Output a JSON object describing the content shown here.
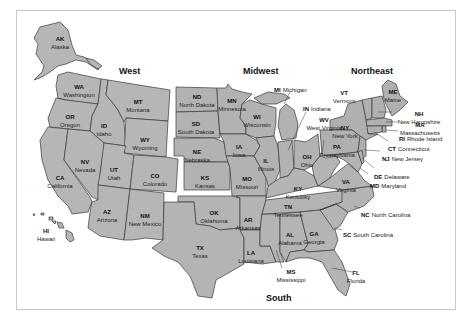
{
  "map": {
    "title": "United States Census Regions",
    "fill_color": "#b4b4b4",
    "border_color": "#3a3a3a",
    "background": "#ffffff",
    "frame_color": "#c8c8c8"
  },
  "regions": {
    "west": "West",
    "midwest": "Midwest",
    "northeast": "Northeast",
    "south": "South"
  },
  "states": {
    "AK": {
      "abbr": "AK",
      "name": "Alaska",
      "region": "West"
    },
    "HI": {
      "abbr": "HI",
      "name": "Hawaii",
      "region": "West"
    },
    "WA": {
      "abbr": "WA",
      "name": "Washington",
      "region": "West"
    },
    "OR": {
      "abbr": "OR",
      "name": "Oregon",
      "region": "West"
    },
    "CA": {
      "abbr": "CA",
      "name": "California",
      "region": "West"
    },
    "ID": {
      "abbr": "ID",
      "name": "Idaho",
      "region": "West"
    },
    "NV": {
      "abbr": "NV",
      "name": "Nevada",
      "region": "West"
    },
    "MT": {
      "abbr": "MT",
      "name": "Montana",
      "region": "West"
    },
    "WY": {
      "abbr": "WY",
      "name": "Wyoming",
      "region": "West"
    },
    "UT": {
      "abbr": "UT",
      "name": "Utah",
      "region": "West"
    },
    "CO": {
      "abbr": "CO",
      "name": "Colorado",
      "region": "West"
    },
    "AZ": {
      "abbr": "AZ",
      "name": "Arizona",
      "region": "West"
    },
    "NM": {
      "abbr": "NM",
      "name": "New Mexico",
      "region": "West"
    },
    "ND": {
      "abbr": "ND",
      "name": "North Dakota",
      "region": "Midwest"
    },
    "SD": {
      "abbr": "SD",
      "name": "South Dakota",
      "region": "Midwest"
    },
    "NE": {
      "abbr": "NE",
      "name": "Nebraska",
      "region": "Midwest"
    },
    "KS": {
      "abbr": "KS",
      "name": "Kansas",
      "region": "Midwest"
    },
    "MN": {
      "abbr": "MN",
      "name": "Minnesota",
      "region": "Midwest"
    },
    "IA": {
      "abbr": "IA",
      "name": "Iowa",
      "region": "Midwest"
    },
    "MO": {
      "abbr": "MO",
      "name": "Missouri",
      "region": "Midwest"
    },
    "WI": {
      "abbr": "WI",
      "name": "Wisconsin",
      "region": "Midwest"
    },
    "IL": {
      "abbr": "IL",
      "name": "Illinois",
      "region": "Midwest"
    },
    "MI": {
      "abbr": "MI",
      "name": "Michigan",
      "region": "Midwest"
    },
    "IN": {
      "abbr": "IN",
      "name": "Indiana",
      "region": "Midwest"
    },
    "OH": {
      "abbr": "OH",
      "name": "Ohio",
      "region": "Midwest"
    },
    "ME": {
      "abbr": "ME",
      "name": "Maine",
      "region": "Northeast"
    },
    "VT": {
      "abbr": "VT",
      "name": "Vermont",
      "region": "Northeast"
    },
    "NH": {
      "abbr": "NH",
      "name": "New Hampshire",
      "region": "Northeast"
    },
    "MA": {
      "abbr": "MA",
      "name": "Massachusetts",
      "region": "Northeast"
    },
    "RI": {
      "abbr": "RI",
      "name": "Rhode Island",
      "region": "Northeast"
    },
    "CT": {
      "abbr": "CT",
      "name": "Connecticut",
      "region": "Northeast"
    },
    "NY": {
      "abbr": "NY",
      "name": "New York",
      "region": "Northeast"
    },
    "NJ": {
      "abbr": "NJ",
      "name": "New Jersey",
      "region": "Northeast"
    },
    "PA": {
      "abbr": "PA",
      "name": "Pennsylvania",
      "region": "Northeast"
    },
    "OK": {
      "abbr": "OK",
      "name": "Oklahoma",
      "region": "South"
    },
    "TX": {
      "abbr": "TX",
      "name": "Texas",
      "region": "South"
    },
    "AR": {
      "abbr": "AR",
      "name": "Arkansas",
      "region": "South"
    },
    "LA": {
      "abbr": "LA",
      "name": "Louisiana",
      "region": "South"
    },
    "MS": {
      "abbr": "MS",
      "name": "Mississippi",
      "region": "South"
    },
    "AL": {
      "abbr": "AL",
      "name": "Alabama",
      "region": "South"
    },
    "TN": {
      "abbr": "TN",
      "name": "Tennessee",
      "region": "South"
    },
    "KY": {
      "abbr": "KY",
      "name": "Kentucky",
      "region": "South"
    },
    "GA": {
      "abbr": "GA",
      "name": "Georgia",
      "region": "South"
    },
    "FL": {
      "abbr": "FL",
      "name": "Florida",
      "region": "South"
    },
    "SC": {
      "abbr": "SC",
      "name": "South Carolina",
      "region": "South"
    },
    "NC": {
      "abbr": "NC",
      "name": "North Carolina",
      "region": "South"
    },
    "VA": {
      "abbr": "VA",
      "name": "Virginia",
      "region": "South"
    },
    "WV": {
      "abbr": "WV",
      "name": "West Virginia",
      "region": "South"
    },
    "MD": {
      "abbr": "MD",
      "name": "Maryland",
      "region": "South"
    },
    "DE": {
      "abbr": "DE",
      "name": "Delaware",
      "region": "South"
    }
  }
}
